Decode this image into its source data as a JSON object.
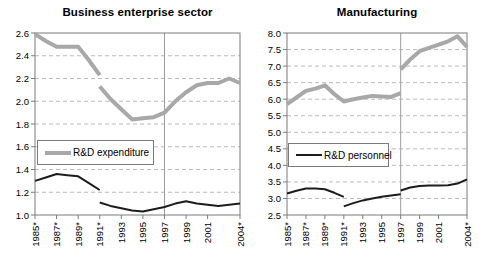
{
  "figure_title_left": "Business enterprise sector",
  "figure_title_right": "Manufacturing",
  "colors": {
    "expenditure_line": "#a8a8a8",
    "personnel_line": "#1c1c1c",
    "gridline": "#bbbbbb",
    "reference_line": "#9c9c9c",
    "plot_border": "#7a7a7a"
  },
  "chart_data": [
    {
      "type": "line",
      "title": "Business enterprise sector",
      "xlabel": "",
      "ylabel": "",
      "x_range": [
        1985,
        2004
      ],
      "ylim": [
        1.0,
        2.6
      ],
      "y_tick_step": 0.2,
      "x_tick_labels": [
        "1985*",
        "1987*",
        "1989*",
        "1991*",
        "1993",
        "1995",
        "1997",
        "1999",
        "2001",
        "2004*"
      ],
      "x_tick_years": [
        1985,
        1987,
        1989,
        1991,
        1993,
        1995,
        1997,
        1999,
        2001,
        2004
      ],
      "ref_line_year": 1997,
      "grid": "dashed-horizontal",
      "legend": {
        "label": "R&D expenditure",
        "position": "middle-left-inside"
      },
      "series": [
        {
          "name": "R&D expenditure",
          "color": "#a8a8a8",
          "width": 4,
          "segments": [
            [
              [
                1985,
                2.59
              ],
              [
                1986,
                2.53
              ],
              [
                1987,
                2.48
              ],
              [
                1988,
                2.48
              ],
              [
                1989,
                2.48
              ],
              [
                1990,
                2.36
              ],
              [
                1991,
                2.23
              ]
            ],
            [
              [
                1991,
                2.13
              ],
              [
                1992,
                2.02
              ],
              [
                1993,
                1.93
              ],
              [
                1994,
                1.84
              ],
              [
                1995,
                1.85
              ],
              [
                1996,
                1.86
              ],
              [
                1997,
                1.9
              ],
              [
                1998,
                2.0
              ],
              [
                1999,
                2.08
              ],
              [
                2000,
                2.14
              ],
              [
                2001,
                2.16
              ],
              [
                2002,
                2.16
              ],
              [
                2003,
                2.2
              ],
              [
                2004,
                2.16
              ]
            ]
          ]
        },
        {
          "name": "R&D personnel",
          "color": "#1c1c1c",
          "width": 2,
          "segments": [
            [
              [
                1985,
                1.3
              ],
              [
                1986,
                1.33
              ],
              [
                1987,
                1.36
              ],
              [
                1988,
                1.35
              ],
              [
                1989,
                1.34
              ],
              [
                1990,
                1.28
              ],
              [
                1991,
                1.22
              ]
            ],
            [
              [
                1991,
                1.11
              ],
              [
                1992,
                1.08
              ],
              [
                1993,
                1.06
              ],
              [
                1994,
                1.04
              ],
              [
                1995,
                1.03
              ],
              [
                1996,
                1.05
              ],
              [
                1997,
                1.07
              ],
              [
                1998,
                1.1
              ],
              [
                1999,
                1.12
              ],
              [
                2000,
                1.1
              ],
              [
                2001,
                1.09
              ],
              [
                2002,
                1.08
              ],
              [
                2003,
                1.09
              ],
              [
                2004,
                1.1
              ]
            ]
          ]
        }
      ]
    },
    {
      "type": "line",
      "title": "Manufacturing",
      "xlabel": "",
      "ylabel": "",
      "x_range": [
        1985,
        2004
      ],
      "ylim": [
        2.5,
        8.0
      ],
      "y_tick_step": 0.5,
      "x_tick_labels": [
        "1985*",
        "1987*",
        "1989*",
        "1991*",
        "1993",
        "1995",
        "1997",
        "1999",
        "2001",
        "2004*"
      ],
      "x_tick_years": [
        1985,
        1987,
        1989,
        1991,
        1993,
        1995,
        1997,
        1999,
        2001,
        2004
      ],
      "ref_line_year": 1997,
      "grid": "dashed-horizontal",
      "legend": {
        "label": "R&D personnel",
        "position": "middle-left-inside"
      },
      "series": [
        {
          "name": "R&D expenditure",
          "color": "#a8a8a8",
          "width": 4,
          "segments": [
            [
              [
                1985,
                5.85
              ],
              [
                1986,
                6.05
              ],
              [
                1987,
                6.25
              ],
              [
                1988,
                6.32
              ],
              [
                1989,
                6.42
              ],
              [
                1990,
                6.15
              ],
              [
                1991,
                5.93
              ],
              [
                1992,
                6.0
              ],
              [
                1993,
                6.05
              ],
              [
                1994,
                6.1
              ],
              [
                1995,
                6.08
              ],
              [
                1996,
                6.07
              ],
              [
                1997,
                6.18
              ]
            ],
            [
              [
                1997,
                6.9
              ],
              [
                1998,
                7.2
              ],
              [
                1999,
                7.45
              ],
              [
                2000,
                7.55
              ],
              [
                2001,
                7.65
              ],
              [
                2002,
                7.75
              ],
              [
                2003,
                7.9
              ],
              [
                2004,
                7.58
              ]
            ]
          ]
        },
        {
          "name": "R&D personnel",
          "color": "#1c1c1c",
          "width": 2,
          "segments": [
            [
              [
                1985,
                3.15
              ],
              [
                1986,
                3.23
              ],
              [
                1987,
                3.3
              ],
              [
                1988,
                3.3
              ],
              [
                1989,
                3.28
              ],
              [
                1990,
                3.17
              ],
              [
                1991,
                3.05
              ]
            ],
            [
              [
                1991,
                2.76
              ],
              [
                1992,
                2.86
              ],
              [
                1993,
                2.94
              ],
              [
                1994,
                3.0
              ],
              [
                1995,
                3.05
              ],
              [
                1996,
                3.09
              ],
              [
                1997,
                3.13
              ]
            ],
            [
              [
                1997,
                3.24
              ],
              [
                1998,
                3.33
              ],
              [
                1999,
                3.38
              ],
              [
                2000,
                3.39
              ],
              [
                2001,
                3.39
              ],
              [
                2002,
                3.4
              ],
              [
                2003,
                3.45
              ],
              [
                2004,
                3.58
              ]
            ]
          ]
        }
      ]
    }
  ]
}
